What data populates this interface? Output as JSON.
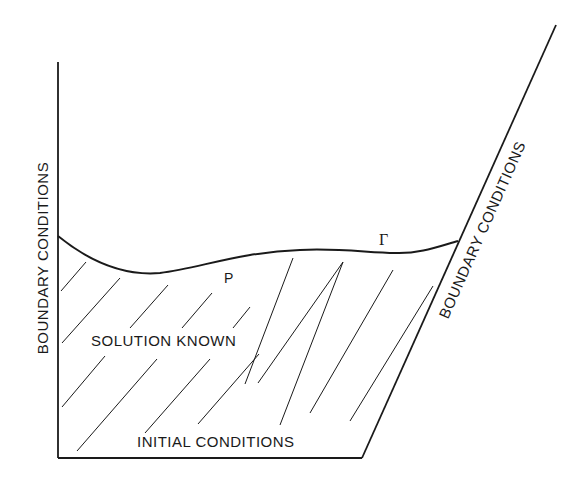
{
  "diagram": {
    "labels": {
      "left_boundary": "BOUNDARY CONDITIONS",
      "right_boundary": "BOUNDARY CONDITIONS",
      "initial": "INITIAL CONDITIONS",
      "region": "SOLUTION KNOWN",
      "point": "P",
      "curve": "Γ"
    },
    "colors": {
      "ink": "#1a1a1a",
      "background": "#ffffff"
    }
  }
}
